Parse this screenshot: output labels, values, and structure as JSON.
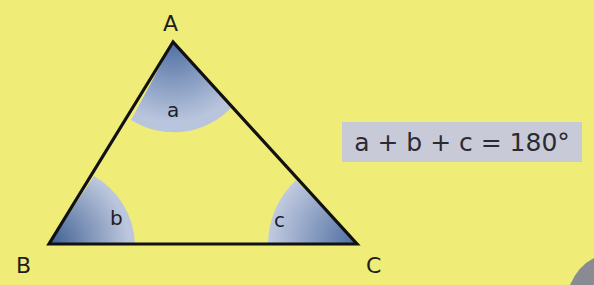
{
  "diagram": {
    "vertices": [
      {
        "name": "A",
        "x": 173,
        "y": 42
      },
      {
        "name": "B",
        "x": 49,
        "y": 244
      },
      {
        "name": "C",
        "x": 357,
        "y": 244
      }
    ],
    "angles": [
      {
        "label": "a",
        "vertex": "A"
      },
      {
        "label": "b",
        "vertex": "B"
      },
      {
        "label": "c",
        "vertex": "C"
      }
    ],
    "formula": "a + b + c = 180°",
    "colors": {
      "background": "#f0ec78",
      "angle_fill_light": "#c3cce0",
      "angle_fill_dark": "#4a6a9c",
      "stroke": "#111111",
      "formula_box": "#c9cad8"
    }
  }
}
